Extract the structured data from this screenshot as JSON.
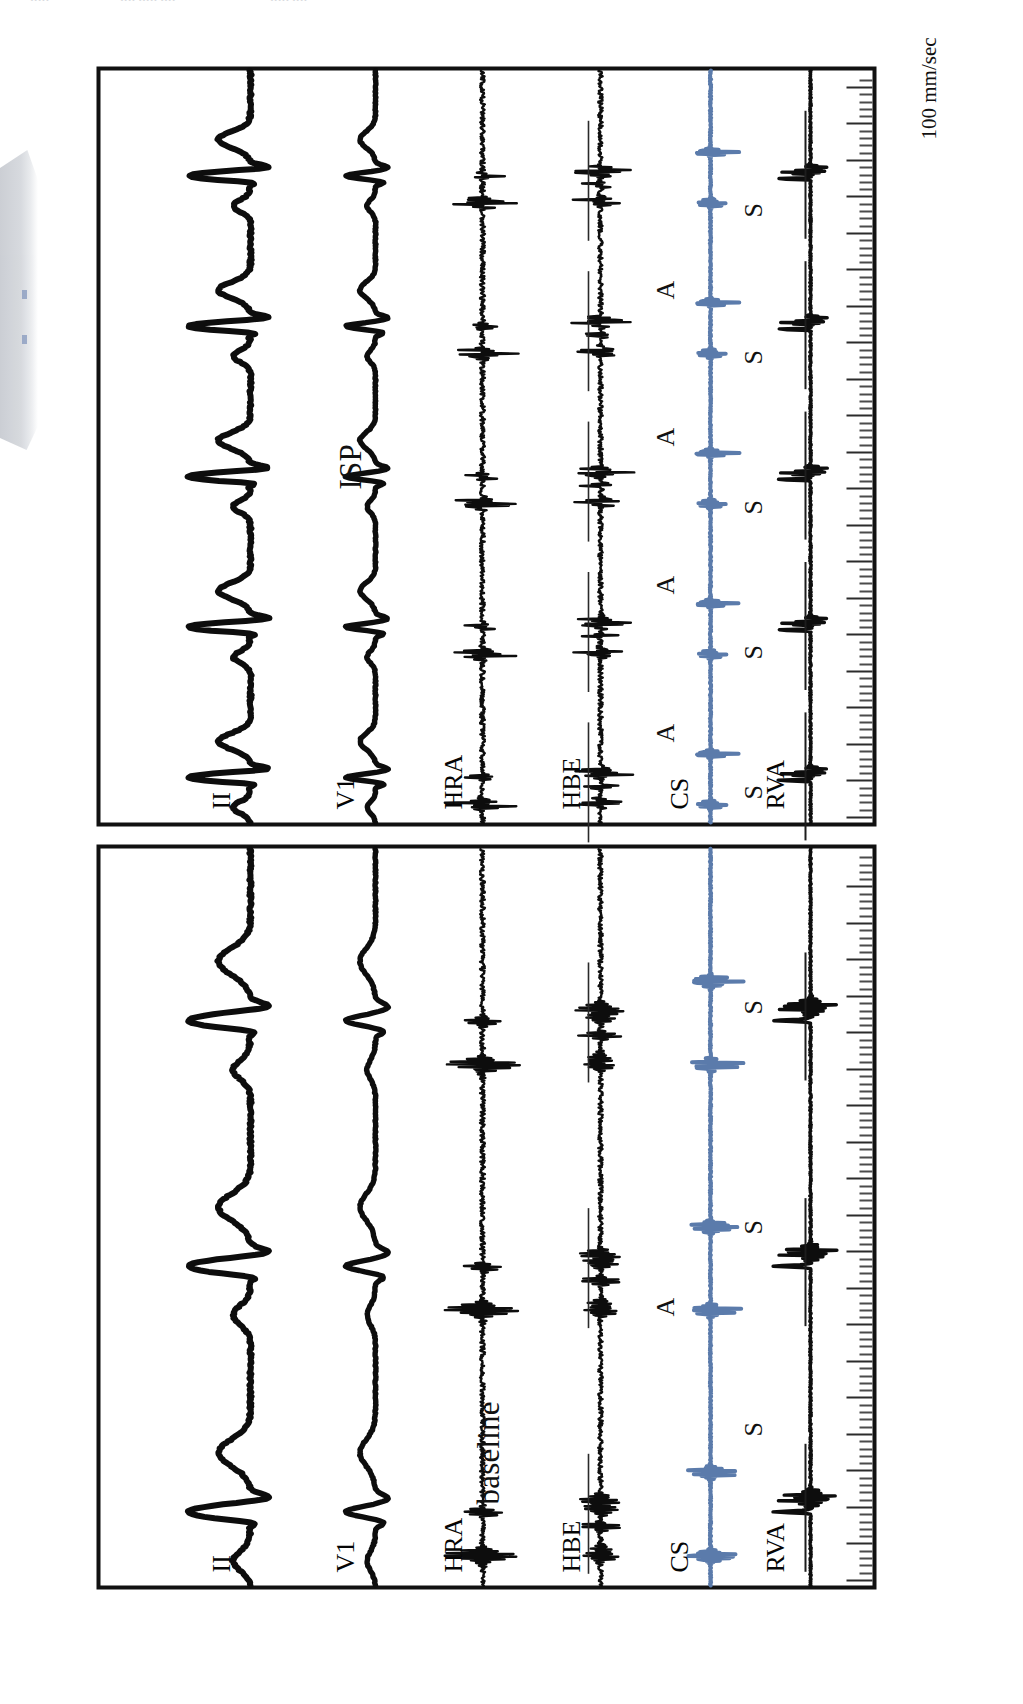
{
  "figure": {
    "type": "electrophysiology-recording",
    "orientation_note": "figure rendered rotated 90 degrees counter-clockwise",
    "speed_label": "100 mm/sec",
    "panels": [
      {
        "id": "baseline",
        "label": "baseline"
      },
      {
        "id": "isp",
        "label": "ISP"
      }
    ],
    "channels": [
      "II",
      "V1",
      "HRA",
      "HBE",
      "CS",
      "RVA"
    ],
    "annotations": {
      "stimulus_letter": "S",
      "atrial_letter": "A"
    },
    "colors": {
      "trace_black": "#0d0d0d",
      "trace_blue": "#5b7bab",
      "frame": "#111111",
      "tick": "#4b4b4b",
      "smudge": "#c9ccd2"
    }
  },
  "top_cut_text": {
    "fragments": [
      {
        "text": "•••••",
        "left": 30
      },
      {
        "text": "•••• ••••• ••••",
        "left": 120
      },
      {
        "text": "••••• ••••",
        "left": 270
      }
    ]
  },
  "baseline_panel": {
    "label": "baseline",
    "channel_labels": [
      "II",
      "V1",
      "HRA",
      "HBE",
      "CS",
      "RVA"
    ],
    "stimulus_markers": [
      "S",
      "S",
      "S"
    ],
    "atrial_markers": [
      "A"
    ]
  },
  "isp_panel": {
    "label": "ISP",
    "channel_labels": [
      "II",
      "V1",
      "HRA",
      "HBE",
      "CS",
      "RVA"
    ],
    "stimulus_markers": [
      "S",
      "S",
      "S",
      "S",
      "S"
    ],
    "atrial_markers": [
      "A",
      "A",
      "A",
      "A"
    ]
  },
  "chart_data": {
    "type": "line",
    "subtitle": "",
    "xlabel": "time",
    "ylabel": "",
    "grid": false,
    "legend": "none",
    "paper_speed": "100 mm/sec",
    "panels": [
      {
        "name": "baseline",
        "x_range_ms": [
          0,
          1800
        ],
        "series": [
          {
            "name": "II",
            "color": "#0d0d0d",
            "description": "surface ECG lead II, smooth broad deflections, 3 QRS-T complexes"
          },
          {
            "name": "V1",
            "color": "#0d0d0d",
            "description": "surface ECG lead V1, smooth low-amplitude complexes"
          },
          {
            "name": "HRA",
            "color": "#0d0d0d",
            "description": "high right atrium electrogram, sharp atrial spikes"
          },
          {
            "name": "HBE",
            "color": "#0d0d0d",
            "description": "His bundle electrogram, A-H-V sequence visible"
          },
          {
            "name": "CS",
            "color": "#5b7bab",
            "description": "coronary sinus electrogram, one atrial deflection marked A"
          },
          {
            "name": "RVA",
            "color": "#0d0d0d",
            "description": "right ventricular apex, paced beats marked S"
          }
        ],
        "events": [
          {
            "label": "S",
            "channel": "RVA",
            "t_ms": 250
          },
          {
            "label": "S",
            "channel": "RVA",
            "t_ms": 830
          },
          {
            "label": "S",
            "channel": "RVA",
            "t_ms": 1510
          },
          {
            "label": "A",
            "channel": "CS",
            "t_ms": 480
          }
        ]
      },
      {
        "name": "ISP",
        "x_range_ms": [
          0,
          1800
        ],
        "series": [
          {
            "name": "II",
            "color": "#0d0d0d",
            "description": "surface ECG lead II, faster rate, 5 complexes"
          },
          {
            "name": "V1",
            "color": "#0d0d0d",
            "description": "surface ECG lead V1, faster rate"
          },
          {
            "name": "HRA",
            "color": "#0d0d0d",
            "description": "high right atrium, repetitive atrial activity"
          },
          {
            "name": "HBE",
            "color": "#0d0d0d",
            "description": "His bundle electrogram, repetitive A-H-V"
          },
          {
            "name": "CS",
            "color": "#5b7bab",
            "description": "coronary sinus, four atrial deflections marked A"
          },
          {
            "name": "RVA",
            "color": "#0d0d0d",
            "description": "right ventricular apex, five paced beats marked S"
          }
        ],
        "events": [
          {
            "label": "S",
            "channel": "RVA",
            "t_ms": 120
          },
          {
            "label": "S",
            "channel": "RVA",
            "t_ms": 450
          },
          {
            "label": "S",
            "channel": "RVA",
            "t_ms": 790
          },
          {
            "label": "S",
            "channel": "RVA",
            "t_ms": 1140
          },
          {
            "label": "S",
            "channel": "RVA",
            "t_ms": 1480
          },
          {
            "label": "A",
            "channel": "CS",
            "t_ms": 210
          },
          {
            "label": "A",
            "channel": "CS",
            "t_ms": 560
          },
          {
            "label": "A",
            "channel": "CS",
            "t_ms": 900
          },
          {
            "label": "A",
            "channel": "CS",
            "t_ms": 1250
          }
        ]
      }
    ]
  }
}
